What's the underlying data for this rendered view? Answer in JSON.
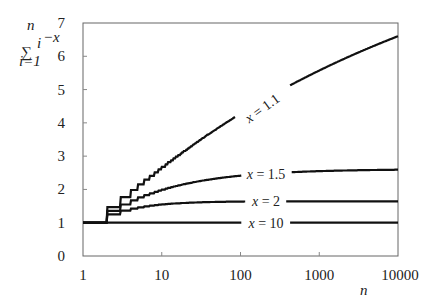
{
  "chart_data": {
    "type": "line",
    "title": "",
    "ylabel": {
      "sum_symbol": "∑",
      "upper": "n",
      "lower": "i=1",
      "term": "i",
      "exponent": "−x"
    },
    "xlabel": "n",
    "xscale": "log",
    "xlim": [
      1,
      10000
    ],
    "ylim": [
      0,
      7
    ],
    "x_ticks": [
      1,
      10,
      100,
      1000,
      10000
    ],
    "x_tick_labels": [
      "1",
      "10",
      "100",
      "1000",
      "10000"
    ],
    "y_ticks": [
      0,
      1,
      2,
      3,
      4,
      5,
      6,
      7
    ],
    "y_tick_labels": [
      "0",
      "1",
      "2",
      "3",
      "4",
      "5",
      "6",
      "7"
    ],
    "grid": false,
    "legend": "inline labels on curves",
    "series": [
      {
        "name": "x = 1.1",
        "label_var": "x",
        "label_val": "= 1.1",
        "exponent": 1.1,
        "x": [
          1,
          10,
          100,
          1000,
          10000
        ],
        "values": [
          1.0,
          2.28,
          3.9,
          5.28,
          6.6
        ]
      },
      {
        "name": "x = 1.5",
        "label_var": "x",
        "label_val": "= 1.5",
        "exponent": 1.5,
        "x": [
          1,
          10,
          100,
          1000,
          10000
        ],
        "values": [
          1.0,
          2.0,
          2.41,
          2.55,
          2.59
        ]
      },
      {
        "name": "x = 2",
        "label_var": "x",
        "label_val": "= 2",
        "exponent": 2,
        "x": [
          1,
          10,
          100,
          1000,
          10000
        ],
        "values": [
          1.0,
          1.55,
          1.63,
          1.64,
          1.645
        ]
      },
      {
        "name": "x = 10",
        "label_var": "x",
        "label_val": "= 10",
        "exponent": 10,
        "x": [
          1,
          10,
          100,
          1000,
          10000
        ],
        "values": [
          1.0,
          1.001,
          1.001,
          1.001,
          1.001
        ]
      }
    ],
    "label_positions": [
      {
        "series": "x = 1.1",
        "cx": 262,
        "cy": 108,
        "rotate": -36,
        "gap_from": 235,
        "gap_to": 290
      },
      {
        "series": "x = 1.5",
        "cx": 266,
        "cy": 174,
        "rotate": 0,
        "gap_from": 242,
        "gap_to": 291
      },
      {
        "series": "x = 2",
        "cx": 266,
        "cy": 201,
        "rotate": 0,
        "gap_from": 246,
        "gap_to": 286
      },
      {
        "series": "x = 10",
        "cx": 266,
        "cy": 223,
        "rotate": 0,
        "gap_from": 242,
        "gap_to": 290
      }
    ]
  },
  "plot_area": {
    "left": 83,
    "top": 23,
    "right": 398,
    "bottom": 256
  },
  "colors": {
    "curve": "#111111",
    "frame": "#666666",
    "text": "#222222"
  }
}
